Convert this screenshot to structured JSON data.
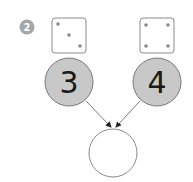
{
  "problem": {
    "number": "2",
    "badge_color": "#a6a6a6"
  },
  "dice": [
    {
      "label": "die-three",
      "pips": 3
    },
    {
      "label": "die-four",
      "pips": 4
    }
  ],
  "circles": [
    {
      "value": "3",
      "fill": "#c8c8c8"
    },
    {
      "value": "4",
      "fill": "#c8c8c8"
    },
    {
      "value": "",
      "fill": "#ffffff"
    }
  ],
  "colors": {
    "stroke": "#7a7a7a",
    "pip": "#8a8a8a",
    "arrow": "#222222",
    "text": "#1a1a1a"
  }
}
